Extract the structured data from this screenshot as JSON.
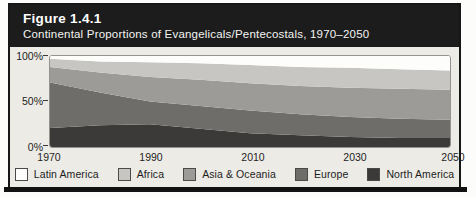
{
  "figure": {
    "label": "Figure 1.4.1",
    "subtitle": "Continental Proportions of Evangelicals/Pentecostals, 1970–2050"
  },
  "axes": {
    "y_tick_labels": [
      "100%",
      "50%",
      "0%"
    ],
    "x_tick_labels": [
      "1970",
      "1990",
      "2010",
      "2030",
      "2050"
    ]
  },
  "chart_data": {
    "type": "area",
    "stacked": true,
    "title": "Continental Proportions of Evangelicals/Pentecostals, 1970–2050",
    "x": [
      1970,
      1980,
      1990,
      2000,
      2010,
      2020,
      2030,
      2040,
      2050
    ],
    "x_tick_labels": [
      "1970",
      "1990",
      "2010",
      "2030",
      "2050"
    ],
    "ylim": [
      0,
      100
    ],
    "y_tick_labels": [
      "100%",
      "50%",
      "0%"
    ],
    "grid": false,
    "legend_position": "bottom",
    "stack_order_bottom_to_top": [
      "North America",
      "Europe",
      "Asia & Oceania",
      "Africa",
      "Latin America"
    ],
    "series": [
      {
        "key": "latin-america",
        "name": "Latin America",
        "color": "#fdfdfc",
        "values": [
          3,
          6,
          7,
          8,
          10,
          12,
          13,
          14.5,
          16
        ]
      },
      {
        "key": "africa",
        "name": "Africa",
        "color": "#c7c6c3",
        "values": [
          9,
          12,
          16,
          18,
          20,
          21,
          22,
          21.5,
          21
        ]
      },
      {
        "key": "asia-oceania",
        "name": "Asia & Oceania",
        "color": "#9c9b98",
        "values": [
          17,
          22,
          27,
          29,
          30,
          31,
          32,
          33,
          33
        ]
      },
      {
        "key": "europe",
        "name": "Europe",
        "color": "#6e6d6a",
        "values": [
          50,
          36,
          25,
          25,
          25,
          23,
          22,
          21,
          20
        ]
      },
      {
        "key": "north-america",
        "name": "North America",
        "color": "#3b3a38",
        "values": [
          21,
          24,
          25,
          20,
          15,
          13,
          11,
          10,
          10
        ]
      }
    ]
  }
}
